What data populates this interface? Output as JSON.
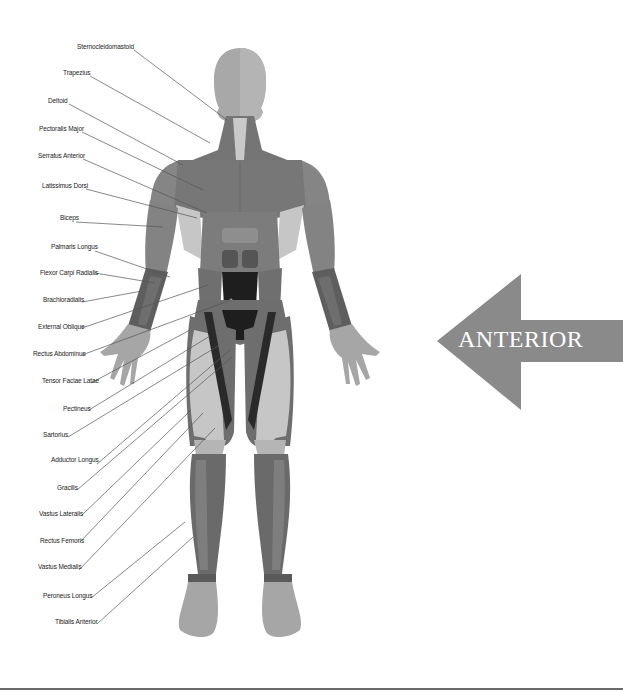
{
  "diagram": {
    "view_label": "ANTERIOR",
    "colors": {
      "arrow_fill": "#8a8a8a",
      "arrow_text": "#ffffff",
      "skin": "#a6a6a6",
      "muscle_dark": "#6e6e6e",
      "muscle_mid": "#7f7f7f",
      "muscle_light": "#c4c4c4",
      "abdominus": "#1e1e1e",
      "leader_line": "#555555"
    },
    "labels": [
      {
        "id": "sternocleidomastoid",
        "text": "Sternocleidomastoid"
      },
      {
        "id": "trapezius",
        "text": "Trapezius"
      },
      {
        "id": "deltoid",
        "text": "Deltoid"
      },
      {
        "id": "pectoralis-major",
        "text": "Pectoralis Major"
      },
      {
        "id": "serratus-anterior",
        "text": "Serratus Anterior"
      },
      {
        "id": "latissimus-dorsi",
        "text": "Latissimus Dorsi"
      },
      {
        "id": "biceps",
        "text": "Biceps"
      },
      {
        "id": "palmaris-longus",
        "text": "Palmaris Longus"
      },
      {
        "id": "flexor-carpi-radialis",
        "text": "Flexor Carpi Radialis"
      },
      {
        "id": "brachioradialis",
        "text": "Brachioradialis"
      },
      {
        "id": "external-oblique",
        "text": "External Oblique"
      },
      {
        "id": "rectus-abdominus",
        "text": "Rectus Abdominus"
      },
      {
        "id": "tensor-faciae-latae",
        "text": "Tensor Faciae Latae"
      },
      {
        "id": "pectineus",
        "text": "Pectineus"
      },
      {
        "id": "sartorius",
        "text": "Sartorius"
      },
      {
        "id": "adductor-longus",
        "text": "Adductor Longus"
      },
      {
        "id": "gracilis",
        "text": "Gracilis"
      },
      {
        "id": "vastus-lateralis",
        "text": "Vastus Lateralis"
      },
      {
        "id": "rectus-femoris",
        "text": "Rectus Femoris"
      },
      {
        "id": "vastus-medialis",
        "text": "Vastus Medialis"
      },
      {
        "id": "peroneus-longus",
        "text": "Peroneus Longus"
      },
      {
        "id": "tibialis-anterior",
        "text": "Tibialis Anterior"
      }
    ]
  }
}
